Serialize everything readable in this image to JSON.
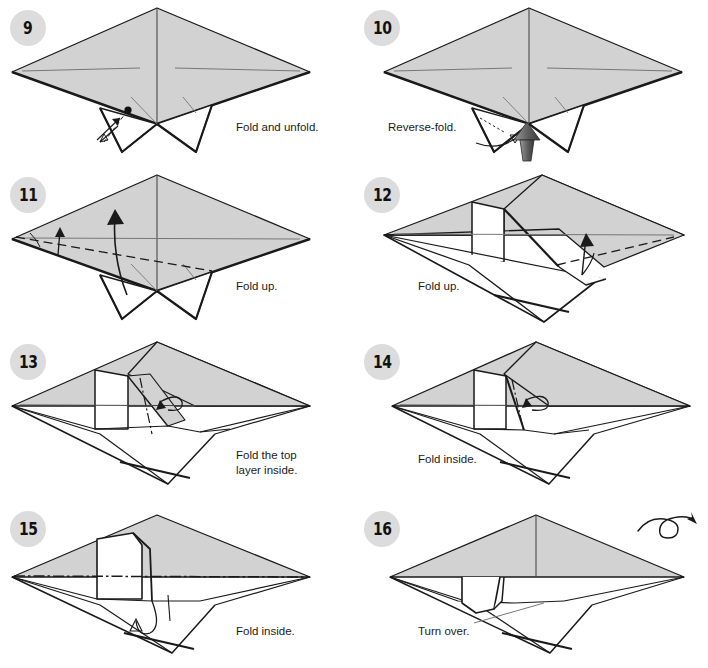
{
  "document": {
    "title": "Origami Folding Instructions",
    "page_range": "Steps 9-16",
    "columns": 2,
    "rows": 4
  },
  "palette": {
    "paper_fill": "#d2d2d2",
    "paper_fill_light": "#ffffff",
    "outline": "#1a1a1a",
    "badge_bg": "#dcdcdc",
    "badge_text": "#111111",
    "caption_text": "#1a1a1a",
    "push_arrow_dark": "#4a4a4a",
    "push_arrow_light": "#8e8e8e",
    "crease_line": "#555555",
    "background": "#ffffff"
  },
  "steps": [
    {
      "number": "9",
      "caption": "Fold and unfold.",
      "caption_x": 236,
      "caption_y": 120,
      "markings": [
        "reference-dot",
        "double-headed-fold-unfold-arrow",
        "dashed-crease"
      ],
      "icons": []
    },
    {
      "number": "10",
      "caption": "Reverse-fold.",
      "caption_x": 34,
      "caption_y": 120,
      "markings": [
        "dotted-crease",
        "curved-arrow",
        "filled-push-arrow"
      ],
      "icons": [
        "push-arrow-icon"
      ]
    },
    {
      "number": "11",
      "caption": "Fold up.",
      "caption_x": 236,
      "caption_y": 112,
      "markings": [
        "dashed-valley-fold",
        "curved-up-arrow",
        "small-up-arrow"
      ],
      "icons": []
    },
    {
      "number": "12",
      "caption": "Fold up.",
      "caption_x": 64,
      "caption_y": 112,
      "markings": [
        "dashed-valley-fold",
        "up-arrow"
      ],
      "icons": []
    },
    {
      "number": "13",
      "caption": "Fold the top\nlayer inside.",
      "caption_x": 236,
      "caption_y": 114,
      "markings": [
        "dash-dot-reverse-fold",
        "curl-arrow"
      ],
      "icons": []
    },
    {
      "number": "14",
      "caption": "Fold inside.",
      "caption_x": 64,
      "caption_y": 118,
      "markings": [
        "dash-dot-reverse-fold",
        "curl-arrow"
      ],
      "icons": []
    },
    {
      "number": "15",
      "caption": "Fold inside.",
      "caption_x": 236,
      "caption_y": 123,
      "markings": [
        "horizontal-dash-dot-line",
        "curl-arrow"
      ],
      "icons": []
    },
    {
      "number": "16",
      "caption": "Turn over.",
      "caption_x": 64,
      "caption_y": 123,
      "markings": [
        "notch-detail",
        "thin-guide-line"
      ],
      "icons": [
        "turn-over-icon"
      ]
    }
  ]
}
